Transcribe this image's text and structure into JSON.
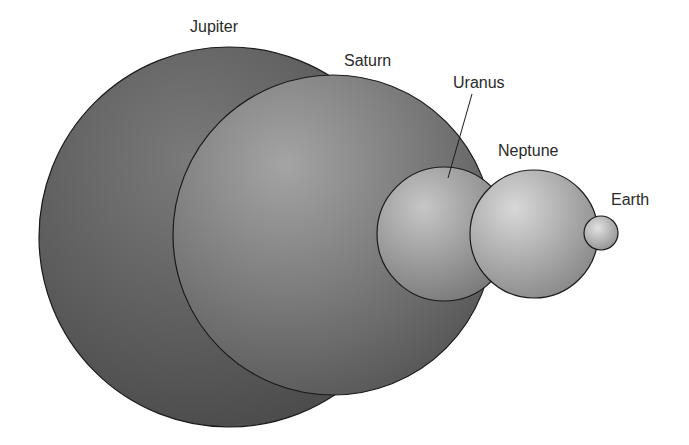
{
  "planets": [
    {
      "name": "Jupiter",
      "cx": 229,
      "cy": 237,
      "r": 190,
      "fill_light": "#7a7a7a",
      "fill_dark": "#4e4e4e",
      "highlight_x": "40%",
      "highlight_y": "30%"
    },
    {
      "name": "Saturn",
      "cx": 333,
      "cy": 235,
      "r": 160,
      "fill_light": "#a2a2a2",
      "fill_dark": "#5c5c5c",
      "highlight_x": "35%",
      "highlight_y": "30%"
    },
    {
      "name": "Uranus",
      "cx": 444,
      "cy": 234,
      "r": 67,
      "fill_light": "#c4c4c4",
      "fill_dark": "#7c7c7c",
      "highlight_x": "35%",
      "highlight_y": "30%"
    },
    {
      "name": "Neptune",
      "cx": 534,
      "cy": 234,
      "r": 64,
      "fill_light": "#d6d6d6",
      "fill_dark": "#8a8a8a",
      "highlight_x": "35%",
      "highlight_y": "30%"
    },
    {
      "name": "Earth",
      "cx": 601,
      "cy": 233,
      "r": 17,
      "fill_light": "#dedede",
      "fill_dark": "#8e8e8e",
      "highlight_x": "40%",
      "highlight_y": "35%"
    }
  ],
  "labels": {
    "jupiter": {
      "text": "Jupiter",
      "x": 190,
      "y": 32
    },
    "saturn": {
      "text": "Saturn",
      "x": 344,
      "y": 66
    },
    "uranus": {
      "text": "Uranus",
      "x": 453,
      "y": 88
    },
    "neptune": {
      "text": "Neptune",
      "x": 498,
      "y": 156
    },
    "earth": {
      "text": "Earth",
      "x": 611,
      "y": 205
    }
  },
  "leader_line": {
    "label": "Uranus",
    "x1": 472,
    "y1": 94,
    "x2": 448,
    "y2": 178
  },
  "colors": {
    "outline": "#1a1a1a",
    "label_text": "#2a2a2a",
    "background": "#ffffff"
  }
}
